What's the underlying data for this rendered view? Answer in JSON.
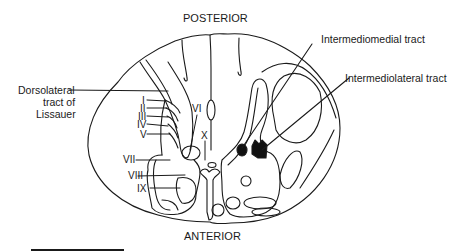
{
  "diagram": {
    "title_top": "POSTERIOR",
    "title_bottom": "ANTERIOR",
    "callouts": {
      "dorsolateral": [
        "Dorsolateral",
        "tract of",
        "Lissauer"
      ],
      "intermediomedial": "Intermediomedial tract",
      "intermediolateral": "Intermediolateral tract"
    },
    "laminae": [
      "I",
      "II",
      "III",
      "IV",
      "V",
      "VI",
      "VII",
      "VIII",
      "IX",
      "X"
    ],
    "colors": {
      "line": "#1a1a1a",
      "fill_tract": "#111111",
      "background": "#ffffff"
    }
  }
}
